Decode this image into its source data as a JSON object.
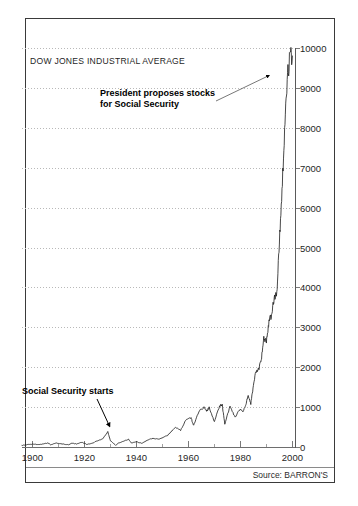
{
  "title": "Talk About Timing!",
  "subtitle": "DOW JONES INDUSTRIAL AVERAGE",
  "source": "Source: BARRON'S",
  "annotations": {
    "president_line1": "President proposes stocks",
    "president_line2": "for Social Security",
    "social_security": "Social Security starts"
  },
  "colors": {
    "line": "#1a1a1a",
    "grid": "#b9b9b9",
    "frame": "#3a3a3a",
    "text": "#1f1f1f",
    "background": "#ffffff"
  },
  "chart_data": {
    "type": "line",
    "title": "Talk About Timing!",
    "subtitle": "DOW JONES INDUSTRIAL AVERAGE",
    "xlabel": "",
    "ylabel": "",
    "xlim": [
      1896,
      2001
    ],
    "ylim": [
      0,
      10000
    ],
    "xticks": [
      1900,
      1920,
      1940,
      1960,
      1980,
      2000
    ],
    "yticks": [
      0,
      1000,
      2000,
      3000,
      4000,
      5000,
      6000,
      7000,
      8000,
      9000,
      10000
    ],
    "ytick_labels": [
      "0",
      "1000",
      "2000",
      "3000",
      "4000",
      "5000",
      "6000",
      "7000",
      "8000",
      "9000",
      "10000"
    ],
    "xtick_labels": [
      "1900",
      "1920",
      "1940",
      "1960",
      "1980",
      "2000"
    ],
    "grid": true,
    "legend": false,
    "y_axis_position": "right",
    "series": [
      {
        "name": "Dow Jones Industrial Average",
        "x": [
          1896,
          1898,
          1900,
          1902,
          1904,
          1906,
          1907,
          1909,
          1911,
          1914,
          1915,
          1917,
          1919,
          1921,
          1923,
          1925,
          1927,
          1929,
          1930,
          1932,
          1933,
          1935,
          1937,
          1938,
          1940,
          1942,
          1945,
          1946,
          1949,
          1952,
          1955,
          1957,
          1959,
          1961,
          1962,
          1964,
          1966,
          1967,
          1968,
          1970,
          1972,
          1973,
          1974,
          1976,
          1978,
          1980,
          1981,
          1982,
          1983,
          1984,
          1985,
          1986,
          1987,
          1988,
          1989,
          1990,
          1991,
          1992,
          1993,
          1994,
          1995,
          1996,
          1997,
          1998,
          1999,
          2000
        ],
        "y": [
          40,
          60,
          70,
          64,
          70,
          103,
          58,
          100,
          82,
          54,
          99,
          74,
          119,
          64,
          94,
          157,
          202,
          381,
          157,
          41,
          99,
          144,
          194,
          99,
          131,
          93,
          193,
          213,
          200,
          292,
          488,
          420,
          679,
          735,
          535,
          891,
          995,
          905,
          985,
          631,
          1036,
          1052,
          578,
          1015,
          742,
          964,
          875,
          1047,
          1287,
          1087,
          1547,
          1896,
          1939,
          2169,
          2753,
          2634,
          3169,
          3301,
          3754,
          3834,
          5117,
          6448,
          7908,
          9181,
          9786,
          9800
        ]
      }
    ],
    "annotations": [
      {
        "text": "President proposes stocks for Social Security",
        "target_x": 1999,
        "target_y": 9700,
        "arrow": "up-right"
      },
      {
        "text": "Social Security starts",
        "target_x": 1935,
        "target_y": 150,
        "arrow": "down-right"
      }
    ]
  }
}
